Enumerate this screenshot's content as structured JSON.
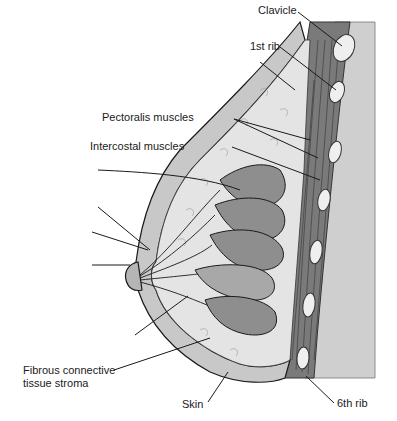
{
  "figure": {
    "colors": {
      "background": "#ffffff",
      "chest_wall": "#cfcfcf",
      "muscle": "#7a7a7a",
      "muscle_dark": "#555555",
      "rib": "#eeeeee",
      "fat": "#e4e4e4",
      "lobule": "#8e8e8e",
      "lobule_light": "#a8a8a8",
      "skin": "#c8c8c8",
      "outline": "#1a1a1a"
    },
    "labels": {
      "clavicle": "Clavicle",
      "first_rib": "1st rib",
      "pectoralis": "Pectoralis muscles",
      "intercostal": "Intercostal muscles",
      "fibrous_line1": "Fibrous connective",
      "fibrous_line2": "tissue stroma",
      "skin": "Skin",
      "sixth_rib": "6th rib"
    }
  }
}
